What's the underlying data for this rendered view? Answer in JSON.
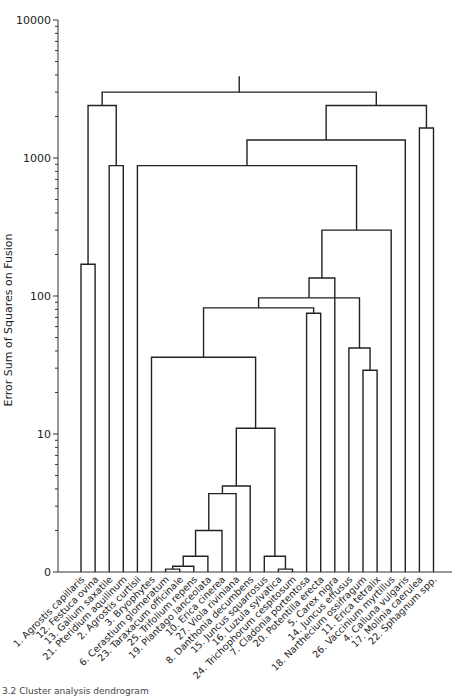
{
  "chart_data": {
    "type": "dendrogram",
    "title": "",
    "ylabel": "Error Sum of Squares on Fusion",
    "yscale": "log",
    "yticks": [
      {
        "label": "10000",
        "value": 10000
      },
      {
        "label": "1000",
        "value": 1000
      },
      {
        "label": "100",
        "value": 100
      },
      {
        "label": "10",
        "value": 10
      },
      {
        "label": "0",
        "value": 1
      }
    ],
    "ylim": [
      1,
      10000
    ],
    "leaves": [
      "1. Agrostis capillaris",
      "12. Festuca ovina",
      "13. Galium saxatile",
      "21. Pteridium aquilinum",
      "2. Agrostis curtisii",
      "3. Bryophytes",
      "6. Cerastium glomeratum",
      "23. Taraxacum officinale",
      "25. Trifolium repens",
      "19. Plantago lanceolata",
      "10. Erica cinerea",
      "27. Viola riviniana",
      "8. Danthonia decumbens",
      "15. Juncus squarrosus",
      "16. Luzula sylvatica",
      "24. Trichophorum cespitosum",
      "7. Cladonia portentosa",
      "20. Potentilla erecta",
      "5. Carex nigra",
      "14. Juncus effusus",
      "18. Narthecium ossifragum",
      "11. Erica tetralix",
      "26. Vaccinium myrtillus",
      "4. Calluna vulgaris",
      "17. Molinia caerulea",
      "22. Sphagnum spp."
    ],
    "merges": [
      {
        "id": "A",
        "children": [
          "L0",
          "L1"
        ],
        "height": 170
      },
      {
        "id": "B",
        "children": [
          "L2",
          "L3"
        ],
        "height": 880
      },
      {
        "id": "C",
        "children": [
          "A",
          "B"
        ],
        "height": 2400
      },
      {
        "id": "D",
        "children": [
          "L6",
          "L7"
        ],
        "height": 1.05
      },
      {
        "id": "E",
        "children": [
          "D",
          "L8"
        ],
        "height": 1.1
      },
      {
        "id": "F",
        "children": [
          "E",
          "L9"
        ],
        "height": 1.3
      },
      {
        "id": "G",
        "children": [
          "F",
          "L10"
        ],
        "height": 2.0
      },
      {
        "id": "H",
        "children": [
          "G",
          "L11"
        ],
        "height": 3.7
      },
      {
        "id": "I",
        "children": [
          "H",
          "L12"
        ],
        "height": 4.2
      },
      {
        "id": "J",
        "children": [
          "L14",
          "L15"
        ],
        "height": 1.05
      },
      {
        "id": "K",
        "children": [
          "L13",
          "J"
        ],
        "height": 1.3
      },
      {
        "id": "M",
        "children": [
          "I",
          "K"
        ],
        "height": 11
      },
      {
        "id": "N",
        "children": [
          "L5",
          "M"
        ],
        "height": 36
      },
      {
        "id": "O",
        "children": [
          "L16",
          "L17"
        ],
        "height": 75
      },
      {
        "id": "P",
        "children": [
          "N",
          "O"
        ],
        "height": 82
      },
      {
        "id": "Q",
        "children": [
          "L20",
          "L21"
        ],
        "height": 29
      },
      {
        "id": "R",
        "children": [
          "L19",
          "Q"
        ],
        "height": 42
      },
      {
        "id": "S",
        "children": [
          "P",
          "R"
        ],
        "height": 97
      },
      {
        "id": "T",
        "children": [
          "S",
          "L18"
        ],
        "height": 135
      },
      {
        "id": "U",
        "children": [
          "T",
          "L22"
        ],
        "height": 300
      },
      {
        "id": "V",
        "children": [
          "L4",
          "U"
        ],
        "height": 880
      },
      {
        "id": "W",
        "children": [
          "V",
          "L23"
        ],
        "height": 1350
      },
      {
        "id": "X",
        "children": [
          "L24",
          "L25"
        ],
        "height": 1650
      },
      {
        "id": "Y",
        "children": [
          "W",
          "X"
        ],
        "height": 2400
      },
      {
        "id": "Z",
        "children": [
          "C",
          "Y"
        ],
        "height": 3000
      }
    ]
  },
  "caption": "3.2 Cluster analysis dendrogram"
}
